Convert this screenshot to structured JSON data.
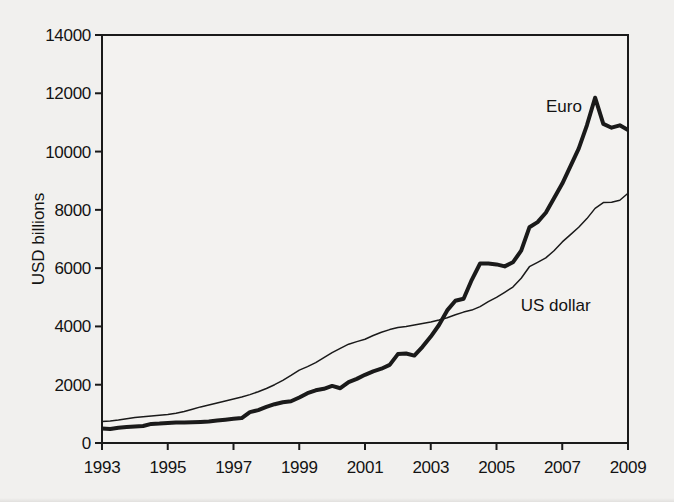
{
  "page": {
    "background": "#f1f0ee"
  },
  "chart_data": {
    "type": "line",
    "title": "",
    "xlabel": "",
    "ylabel": "USD billions",
    "x_range": [
      1993,
      2009
    ],
    "y_range": [
      0,
      14000
    ],
    "x_ticks": [
      1993,
      1995,
      1997,
      1999,
      2001,
      2003,
      2005,
      2007,
      2009
    ],
    "y_ticks": [
      0,
      2000,
      4000,
      6000,
      8000,
      10000,
      12000,
      14000
    ],
    "grid": false,
    "legend_position": "inline",
    "ink_color": "#1a1a1a",
    "plot_fill": "#f3f2f0",
    "series": [
      {
        "id": "euro",
        "name": "Euro",
        "line_width": 4,
        "label": {
          "text": "Euro",
          "x": 2007.05,
          "y": 11560
        },
        "x": [
          1993,
          1993.25,
          1993.5,
          1993.75,
          1994,
          1994.25,
          1994.5,
          1994.75,
          1995,
          1995.25,
          1995.5,
          1995.75,
          1996,
          1996.25,
          1996.5,
          1996.75,
          1997,
          1997.25,
          1997.5,
          1997.75,
          1998,
          1998.25,
          1998.5,
          1998.75,
          1999,
          1999.25,
          1999.5,
          1999.75,
          2000,
          2000.25,
          2000.5,
          2000.75,
          2001,
          2001.25,
          2001.5,
          2001.75,
          2002,
          2002.25,
          2002.5,
          2002.75,
          2003,
          2003.25,
          2003.5,
          2003.75,
          2004,
          2004.25,
          2004.5,
          2004.75,
          2005,
          2005.25,
          2005.5,
          2005.75,
          2006,
          2006.25,
          2006.5,
          2006.75,
          2007,
          2007.25,
          2007.5,
          2007.75,
          2008,
          2008.25,
          2008.5,
          2008.75,
          2009
        ],
        "values": [
          500,
          480,
          520,
          545,
          565,
          585,
          655,
          665,
          685,
          700,
          700,
          710,
          725,
          740,
          770,
          800,
          830,
          855,
          1060,
          1130,
          1240,
          1330,
          1400,
          1430,
          1560,
          1710,
          1810,
          1860,
          1960,
          1880,
          2090,
          2200,
          2340,
          2460,
          2550,
          2680,
          3050,
          3070,
          3000,
          3300,
          3650,
          4050,
          4550,
          4880,
          4950,
          5600,
          6160,
          6160,
          6130,
          6060,
          6200,
          6600,
          7400,
          7580,
          7900,
          8400,
          8900,
          9500,
          10100,
          10900,
          11850,
          10950,
          10820,
          10900,
          10740
        ]
      },
      {
        "id": "us-dollar",
        "name": "US dollar",
        "line_width": 1.5,
        "label": {
          "text": "US dollar",
          "x": 2006.8,
          "y": 4720
        },
        "x": [
          1993,
          1993.25,
          1993.5,
          1993.75,
          1994,
          1994.25,
          1994.5,
          1994.75,
          1995,
          1995.25,
          1995.5,
          1995.75,
          1996,
          1996.25,
          1996.5,
          1996.75,
          1997,
          1997.25,
          1997.5,
          1997.75,
          1998,
          1998.25,
          1998.5,
          1998.75,
          1999,
          1999.25,
          1999.5,
          1999.75,
          2000,
          2000.25,
          2000.5,
          2000.75,
          2001,
          2001.25,
          2001.5,
          2001.75,
          2002,
          2002.25,
          2002.5,
          2002.75,
          2003,
          2003.25,
          2003.5,
          2003.75,
          2004,
          2004.25,
          2004.5,
          2004.75,
          2005,
          2005.25,
          2005.5,
          2005.75,
          2006,
          2006.25,
          2006.5,
          2006.75,
          2007,
          2007.25,
          2007.5,
          2007.75,
          2008,
          2008.25,
          2008.5,
          2008.75,
          2009
        ],
        "values": [
          740,
          760,
          790,
          830,
          870,
          900,
          930,
          950,
          975,
          1020,
          1080,
          1160,
          1240,
          1300,
          1370,
          1440,
          1510,
          1580,
          1660,
          1760,
          1870,
          2000,
          2150,
          2320,
          2500,
          2620,
          2760,
          2930,
          3100,
          3250,
          3390,
          3480,
          3560,
          3690,
          3800,
          3890,
          3960,
          4000,
          4050,
          4100,
          4150,
          4220,
          4300,
          4400,
          4490,
          4560,
          4680,
          4850,
          5000,
          5170,
          5350,
          5650,
          6050,
          6200,
          6350,
          6600,
          6900,
          7150,
          7400,
          7700,
          8050,
          8250,
          8260,
          8330,
          8570
        ]
      }
    ]
  }
}
